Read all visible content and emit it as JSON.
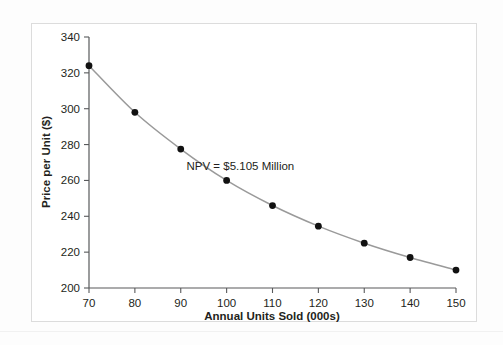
{
  "figure": {
    "margin_note": "",
    "frame_color": "#dcdcdc",
    "background_color": "#ffffff"
  },
  "chart_data": {
    "type": "line",
    "title": "",
    "subtitle": "",
    "xlabel": "Annual Units Sold (000s)",
    "ylabel": "Price per Unit ($)",
    "xlim": [
      70,
      150
    ],
    "ylim": [
      200,
      340
    ],
    "xticks": [
      70,
      80,
      90,
      100,
      110,
      120,
      130,
      140,
      150
    ],
    "xticklabels": [
      "70",
      "80",
      "90",
      "100",
      "110",
      "120",
      "130",
      "140",
      "150"
    ],
    "yticks": [
      200,
      220,
      240,
      260,
      280,
      300,
      320,
      340
    ],
    "yticklabels": [
      "200",
      "220",
      "240",
      "260",
      "280",
      "300",
      "320",
      "340"
    ],
    "grid": false,
    "legend": null,
    "marker_color": "#111111",
    "line_color": "#9a9a9a",
    "x": [
      70,
      80,
      90,
      100,
      110,
      120,
      130,
      140,
      150
    ],
    "values": [
      324,
      298,
      277.5,
      260,
      246,
      234.5,
      225,
      217,
      210
    ],
    "series": [
      {
        "name": "Price per Unit",
        "x": [
          70,
          80,
          90,
          100,
          110,
          120,
          130,
          140,
          150
        ],
        "values": [
          324,
          298,
          277.5,
          260,
          246,
          234.5,
          225,
          217,
          210
        ]
      }
    ],
    "annotations": [
      {
        "text": "NPV = $5.105 Million",
        "x": 103,
        "y": 266
      }
    ]
  }
}
